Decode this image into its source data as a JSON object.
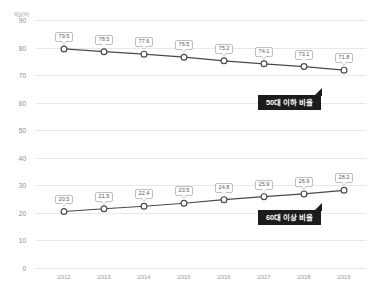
{
  "chart_data": {
    "type": "line",
    "title": "",
    "subtitle": "",
    "xlabel": "",
    "ylabel": "",
    "unit_label": "비율(%)",
    "categories": [
      "2012",
      "2013",
      "2014",
      "2015",
      "2016",
      "2017",
      "2018",
      "2019"
    ],
    "ylim": [
      0,
      90
    ],
    "ytick_values": [
      0,
      10,
      20,
      30,
      40,
      50,
      60,
      70,
      80,
      90
    ],
    "ytick_labels": [
      "0",
      "10",
      "20",
      "30",
      "40",
      "50",
      "60",
      "70",
      "80",
      "90"
    ],
    "grid": true,
    "legend_position": "annotation-callouts",
    "series": [
      {
        "name": "50대 이하 비율",
        "values": [
          79.5,
          78.5,
          77.6,
          76.5,
          75.2,
          74.1,
          73.1,
          71.8
        ],
        "labels": [
          "79.5",
          "78.5",
          "77.6",
          "76.5",
          "75.2",
          "74.1",
          "73.1",
          "71.8"
        ],
        "color": "#4a4a4a",
        "marker": "circle-open"
      },
      {
        "name": "60대 이상 비율",
        "values": [
          20.5,
          21.5,
          22.4,
          23.5,
          24.8,
          25.9,
          26.9,
          28.2
        ],
        "labels": [
          "20.5",
          "21.5",
          "22.4",
          "23.5",
          "24.8",
          "25.9",
          "26.9",
          "28.2"
        ],
        "color": "#4a4a4a",
        "marker": "circle-open"
      }
    ],
    "annotations": [
      {
        "text": "50대 이하 비율",
        "series": "50대 이하 비율",
        "background": "#1c1c1c",
        "text_color": "#ffffff"
      },
      {
        "text": "60대 이상 비율",
        "series": "60대 이상 비율",
        "background": "#1c1c1c",
        "text_color": "#ffffff"
      }
    ],
    "colors": {
      "gridline": "#e8e8e8",
      "tick_text": "#9a9a9a",
      "line": "#4a4a4a",
      "marker_fill": "#ffffff",
      "label_box_border": "#bdbdbd",
      "label_text": "#5a5a5a",
      "callout_bg": "#1c1c1c",
      "background": "#ffffff"
    }
  }
}
